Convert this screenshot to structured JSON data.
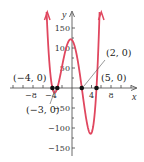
{
  "chart_data": {
    "type": "line",
    "title": "",
    "function": "f(x) = (x + 4)(x + 3)(x - 2)(x - 5)",
    "xlabel": "x",
    "ylabel": "y",
    "xlim": [
      -13,
      13
    ],
    "ylim": [
      -180,
      190
    ],
    "x_ticks": [
      -8,
      -4,
      4,
      8
    ],
    "x_tick_labels": [
      "-8",
      "-4",
      "4",
      "8"
    ],
    "x_minor_ticks": [
      -12,
      -10,
      -6,
      -2,
      2,
      6,
      10,
      12
    ],
    "y_ticks": [
      150,
      100,
      50,
      -50,
      -100,
      -150
    ],
    "y_tick_labels": [
      "150",
      "100",
      "50",
      "-50",
      "-100",
      "-150"
    ],
    "y_minor_ticks": [
      125,
      75,
      25,
      -25,
      -75,
      -125
    ],
    "grid": false,
    "series": [
      {
        "name": "f(x)",
        "color": "#e0475f",
        "x": [
          -5.2,
          -5,
          -4.5,
          -4,
          -3.5,
          -3,
          -2.5,
          -2,
          -1.5,
          -1,
          -0.5,
          0,
          0.5,
          1,
          1.5,
          2,
          2.5,
          3,
          3.5,
          4,
          4.5,
          5,
          5.5,
          6
        ],
        "values": [
          181.4,
          140,
          42.2,
          0,
          -10.7,
          0,
          20.6,
          40,
          58.5,
          72,
          78.8,
          120,
          102.2,
          60,
          43.9,
          0,
          -35.6,
          -72,
          -117.2,
          -96,
          -70.3,
          0,
          89.1,
          360
        ]
      }
    ],
    "x_intercepts": [
      {
        "x": -4,
        "y": 0,
        "label": "(−4, 0)"
      },
      {
        "x": -3,
        "y": 0,
        "label": "(−3, 0)"
      },
      {
        "x": 2,
        "y": 0,
        "label": "(2, 0)"
      },
      {
        "x": 5,
        "y": 0,
        "label": "(5, 0)"
      }
    ],
    "local_max": {
      "x": 0,
      "y": 120
    },
    "local_min": {
      "x": 3.6,
      "y": -120
    }
  },
  "labels": {
    "x_axis": "x",
    "y_axis": "y",
    "xt_m8": "−8",
    "xt_m4": "−4",
    "xt_4": "4",
    "xt_8": "8",
    "yt_150": "150",
    "yt_100": "100",
    "yt_50": "50",
    "yt_m50": "−50",
    "yt_m100": "−100",
    "yt_m150": "−150",
    "pt_m4": "(−4, 0)",
    "pt_m3": "(−3, 0)",
    "pt_2": "(2, 0)",
    "pt_5": "(5, 0)"
  },
  "colors": {
    "curve": "#e0475f",
    "axis": "#444444",
    "point": "#111111"
  }
}
